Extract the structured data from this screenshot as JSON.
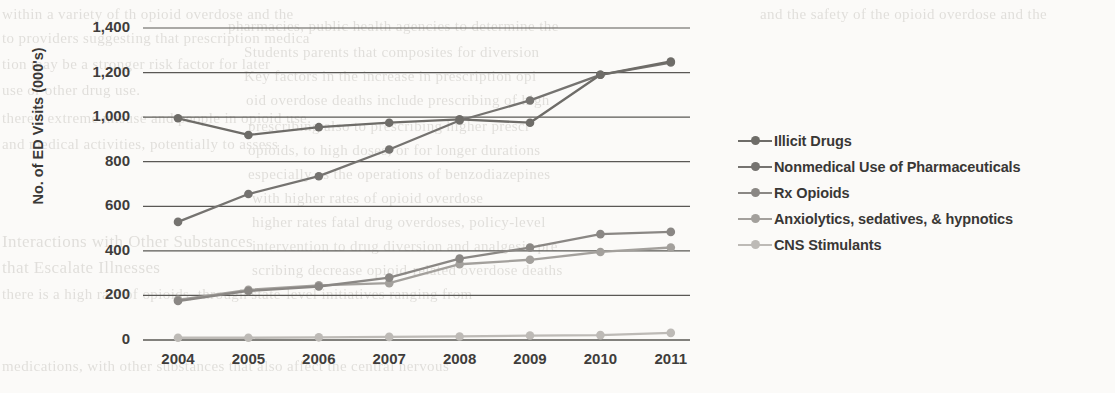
{
  "chart_data": {
    "type": "line",
    "title": "",
    "xlabel": "",
    "ylabel": "No. of ED Visits (000's)",
    "categories": [
      "2004",
      "2005",
      "2006",
      "2007",
      "2008",
      "2009",
      "2010",
      "2011"
    ],
    "ylim": [
      0,
      1400
    ],
    "yticks": [
      0,
      200,
      400,
      600,
      800,
      1000,
      1200,
      1400
    ],
    "ytick_labels": [
      "0",
      "200",
      "400",
      "600",
      "800",
      "1,000",
      "1,200",
      "1,400"
    ],
    "grid": "horizontal",
    "legend_position": "right",
    "markers": "filled-circle",
    "series": [
      {
        "name": "Illicit Drugs",
        "color": "#6e6c68",
        "values": [
          995,
          920,
          955,
          975,
          990,
          975,
          1190,
          1250
        ]
      },
      {
        "name": "Nonmedical Use of Pharmaceuticals",
        "color": "#757370",
        "values": [
          530,
          655,
          735,
          855,
          985,
          1075,
          1190,
          1245
        ]
      },
      {
        "name": "Rx Opioids",
        "color": "#8a8784",
        "values": [
          175,
          220,
          240,
          280,
          365,
          415,
          475,
          485
        ]
      },
      {
        "name": "Anxiolytics, sedatives, & hypnotics",
        "color": "#a3a09c",
        "values": [
          180,
          225,
          245,
          255,
          340,
          360,
          395,
          415
        ]
      },
      {
        "name": "CNS Stimulants",
        "color": "#bdbab6",
        "values": [
          10,
          10,
          12,
          14,
          16,
          20,
          22,
          32
        ]
      }
    ]
  },
  "ghost_text": {
    "lines": [
      {
        "t": "and the safety of the opioid overdose and the",
        "x": 760,
        "y": 6,
        "size": 15,
        "flip": false
      },
      {
        "t": "within a variety of th opioid overdose and the",
        "x": 2,
        "y": 6,
        "size": 15,
        "flip": false
      },
      {
        "t": "pharmacies, public health agencies to determine the",
        "x": 228,
        "y": 18,
        "size": 15,
        "flip": false
      },
      {
        "t": "Students parents that composites for diversion",
        "x": 244,
        "y": 44,
        "size": 15,
        "flip": false
      },
      {
        "t": "to providers suggesting that prescription medica",
        "x": 2,
        "y": 30,
        "size": 15,
        "flip": false
      },
      {
        "t": "Key factors in the increase in prescription opi",
        "x": 244,
        "y": 68,
        "size": 15,
        "flip": false
      },
      {
        "t": "tion may be a stronger risk factor for later",
        "x": 2,
        "y": 56,
        "size": 15,
        "flip": false
      },
      {
        "t": "oid overdose deaths include prescribing of high",
        "x": 246,
        "y": 92,
        "size": 15,
        "flip": false
      },
      {
        "t": "use or other drug use.",
        "x": 2,
        "y": 82,
        "size": 15,
        "flip": false
      },
      {
        "t": "prescribing also to prescribing higher  prescr",
        "x": 248,
        "y": 118,
        "size": 15,
        "flip": false
      },
      {
        "t": "there's extreme misuse and people in opioid use.",
        "x": 2,
        "y": 110,
        "size": 15,
        "flip": false
      },
      {
        "t": "opioids, to high doses, or for longer durations",
        "x": 248,
        "y": 142,
        "size": 15,
        "flip": false
      },
      {
        "t": "and medical activities, potentially to assess",
        "x": 2,
        "y": 136,
        "size": 15,
        "flip": false
      },
      {
        "t": "especially as the operations of benzodiazepines",
        "x": 248,
        "y": 166,
        "size": 15,
        "flip": false
      },
      {
        "t": "with higher rates of opioid  overdose",
        "x": 252,
        "y": 190,
        "size": 15,
        "flip": false
      },
      {
        "t": "higher rates fatal drug overdoses, policy-level",
        "x": 252,
        "y": 214,
        "size": 15,
        "flip": false
      },
      {
        "t": "intervention to drug diversion and analgesic pre",
        "x": 252,
        "y": 238,
        "size": 15,
        "flip": false
      },
      {
        "t": "Interactions with Other Substances",
        "x": 2,
        "y": 232,
        "size": 17,
        "flip": false
      },
      {
        "t": "that Escalate Illnesses",
        "x": 2,
        "y": 258,
        "size": 17,
        "flip": false
      },
      {
        "t": "scribing decrease opioid-related overdose deaths",
        "x": 252,
        "y": 262,
        "size": 15,
        "flip": false
      },
      {
        "t": "there is a high rate of opioids, through state-level initiatives ranging from",
        "x": 2,
        "y": 286,
        "size": 15,
        "flip": false
      },
      {
        "t": "medications, with other substances that also affect the central nervous",
        "x": 2,
        "y": 358,
        "size": 15,
        "flip": false
      }
    ]
  }
}
